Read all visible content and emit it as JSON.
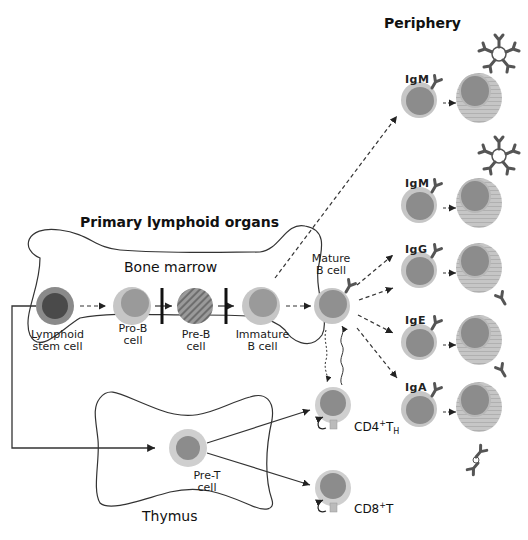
{
  "headings": {
    "periphery": "Periphery",
    "primary_lymphoid_organs": "Primary lymphoid organs"
  },
  "organs": {
    "bone_marrow": "Bone marrow",
    "thymus": "Thymus"
  },
  "bone_marrow_cells": [
    {
      "label1": "Lymphoid",
      "label2": "stem cell"
    },
    {
      "label1": "Pro-B",
      "label2": "cell"
    },
    {
      "label1": "Pre-B",
      "label2": "cell"
    },
    {
      "label1": "Immature",
      "label2": "B cell"
    }
  ],
  "mature_b_cell": {
    "label1": "Mature",
    "label2": "B cell"
  },
  "pre_t_cell": {
    "label1": "Pre-T",
    "label2": "cell"
  },
  "t_cells": [
    {
      "label": "CD4",
      "sup": "+",
      "main": "T",
      "sub": "H"
    },
    {
      "label": "CD8",
      "sup": "+",
      "main": "T",
      "sub": ""
    }
  ],
  "plasma_lineages": [
    {
      "isotype": "IgM",
      "secreted": "pentamer"
    },
    {
      "isotype": "IgM",
      "secreted": "pentamer"
    },
    {
      "isotype": "IgG",
      "secreted": "monomer"
    },
    {
      "isotype": "IgE",
      "secreted": "monomer"
    },
    {
      "isotype": "IgA",
      "secreted": "dimer"
    }
  ],
  "colors": {
    "outer_cell": "#c8c8c8",
    "inner_cell": "#8c8c8c",
    "stem_inner": "#4a4a4a",
    "stem_outer": "#8a8a8a",
    "antibody": "#555555",
    "line": "#222222"
  }
}
